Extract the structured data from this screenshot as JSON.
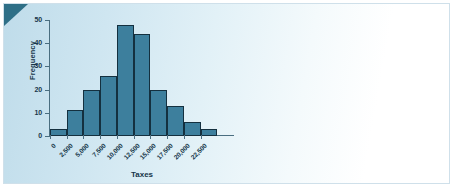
{
  "panel": {
    "background_left_color": "#bfdcea",
    "background_right_color": "#ffffff",
    "corner_accent_color": "#2e6f87",
    "border_color": "#cfe0ea"
  },
  "chart_data": {
    "type": "bar",
    "title": "",
    "subtitle": "",
    "xlabel": "Taxes",
    "ylabel": "Frequency",
    "categories": [
      "0",
      "2,500",
      "5,000",
      "7,500",
      "10,000",
      "12,500",
      "15,000",
      "17,500",
      "20,000",
      "22,500"
    ],
    "bin_edges": [
      0,
      2500,
      5000,
      7500,
      10000,
      12500,
      15000,
      17500,
      20000,
      22500,
      25000
    ],
    "values": [
      3,
      11,
      20,
      26,
      48,
      44,
      20,
      13,
      6,
      3
    ],
    "ylim": [
      0,
      50
    ],
    "yticks": [
      0,
      10,
      20,
      30,
      40,
      50
    ],
    "ytick_labels": [
      "0",
      "10",
      "20",
      "30",
      "40",
      "50"
    ],
    "xtick_labels": [
      "0",
      "2,500",
      "5,000",
      "7,500",
      "10,000",
      "12,500",
      "15,000",
      "17,500",
      "20,000",
      "22,500"
    ],
    "xtick_rotation": -45,
    "grid": false,
    "legend": null,
    "bar_fill_color": "#3d7f9d",
    "bar_edge_color": "#14303f",
    "axis_color": "#4a6e80",
    "text_color": "#17364a"
  }
}
